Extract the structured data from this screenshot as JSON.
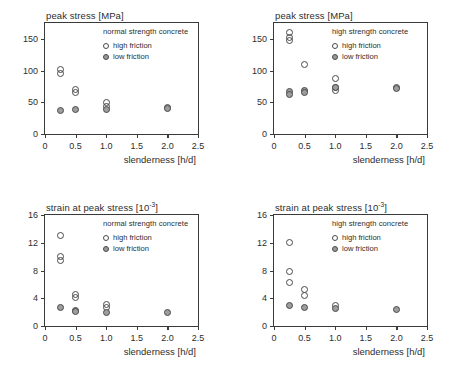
{
  "figure": {
    "panels": [
      {
        "key": "top-left",
        "ylabel": "peak stress [MPa]",
        "xlabel": "slenderness [h/d]",
        "legend_title": "normal strength concrete",
        "legend": [
          {
            "marker": "open-circle",
            "label": "high friction"
          },
          {
            "marker": "filled-circle",
            "label": "low friction"
          }
        ]
      },
      {
        "key": "top-right",
        "ylabel": "peak stress [MPa]",
        "xlabel": "slenderness [h/d]",
        "legend_title": "high strength concrete",
        "legend": [
          {
            "marker": "open-circle",
            "label": "high friction"
          },
          {
            "marker": "filled-circle",
            "label": "low friction"
          }
        ]
      },
      {
        "key": "bottom-left",
        "ylabel_html": "strain at peak stress [10<sup>-3</sup>]",
        "ylabel": "strain at peak stress [10-3]",
        "xlabel": "slenderness [h/d]",
        "legend_title": "normal strength concrete",
        "legend": [
          {
            "marker": "open-circle",
            "label": "high friction"
          },
          {
            "marker": "filled-circle",
            "label": "low friction"
          }
        ]
      },
      {
        "key": "bottom-right",
        "ylabel_html": "strain at peak stress [10<sup>-3</sup>]",
        "ylabel": "strain at peak stress [10-3]",
        "xlabel": "slenderness [h/d]",
        "legend_title": "high strength concrete",
        "legend": [
          {
            "marker": "open-circle",
            "label": "high friction"
          },
          {
            "marker": "filled-circle",
            "label": "low friction"
          }
        ]
      }
    ]
  },
  "chart_data": [
    {
      "id": "top-left",
      "type": "scatter",
      "title": "",
      "subtitle": "normal strength concrete",
      "xlabel": "slenderness [h/d]",
      "ylabel": "peak stress [MPa]",
      "xlim": [
        0,
        2.5
      ],
      "ylim": [
        0,
        175
      ],
      "xticks": [
        0,
        0.5,
        1.0,
        1.5,
        2.0,
        2.5
      ],
      "xticklabels": [
        "0",
        "0.5",
        "1.0",
        "1.5",
        "2.0",
        "2.5"
      ],
      "yticks": [
        0,
        50,
        100,
        150
      ],
      "yticklabels": [
        "0",
        "50",
        "100",
        "150"
      ],
      "grid": false,
      "legend_position": "upper-right-inside",
      "series": [
        {
          "name": "high friction",
          "marker": "open-circle",
          "points": [
            {
              "x": 0.25,
              "y": 102
            },
            {
              "x": 0.25,
              "y": 95
            },
            {
              "x": 0.5,
              "y": 70
            },
            {
              "x": 0.5,
              "y": 66
            },
            {
              "x": 1.0,
              "y": 50
            },
            {
              "x": 1.0,
              "y": 44
            },
            {
              "x": 2.0,
              "y": 41
            }
          ]
        },
        {
          "name": "low friction",
          "marker": "filled-circle",
          "points": [
            {
              "x": 0.25,
              "y": 37
            },
            {
              "x": 0.5,
              "y": 38
            },
            {
              "x": 1.0,
              "y": 39
            },
            {
              "x": 2.0,
              "y": 40
            }
          ]
        }
      ]
    },
    {
      "id": "top-right",
      "type": "scatter",
      "title": "",
      "subtitle": "high strength concrete",
      "xlabel": "slenderness [h/d]",
      "ylabel": "peak stress [MPa]",
      "xlim": [
        0,
        2.5
      ],
      "ylim": [
        0,
        175
      ],
      "xticks": [
        0,
        0.5,
        1.0,
        1.5,
        2.0,
        2.5
      ],
      "xticklabels": [
        "0",
        "0.5",
        "1.0",
        "1.5",
        "2.0",
        "2.5"
      ],
      "yticks": [
        0,
        50,
        100,
        150
      ],
      "yticklabels": [
        "0",
        "50",
        "100",
        "150"
      ],
      "grid": false,
      "legend_position": "upper-right-inside",
      "series": [
        {
          "name": "high friction",
          "marker": "open-circle",
          "points": [
            {
              "x": 0.25,
              "y": 160
            },
            {
              "x": 0.25,
              "y": 152
            },
            {
              "x": 0.25,
              "y": 148
            },
            {
              "x": 0.5,
              "y": 109
            },
            {
              "x": 1.0,
              "y": 88
            },
            {
              "x": 1.0,
              "y": 74
            },
            {
              "x": 1.0,
              "y": 69
            },
            {
              "x": 2.0,
              "y": 74
            }
          ]
        },
        {
          "name": "low friction",
          "marker": "filled-circle",
          "points": [
            {
              "x": 0.25,
              "y": 67
            },
            {
              "x": 0.25,
              "y": 63
            },
            {
              "x": 0.5,
              "y": 68
            },
            {
              "x": 0.5,
              "y": 65
            },
            {
              "x": 1.0,
              "y": 73
            },
            {
              "x": 2.0,
              "y": 71
            }
          ]
        }
      ]
    },
    {
      "id": "bottom-left",
      "type": "scatter",
      "title": "",
      "subtitle": "normal strength concrete",
      "xlabel": "slenderness [h/d]",
      "ylabel": "strain at peak stress [10-3]",
      "xlim": [
        0,
        2.5
      ],
      "ylim": [
        0,
        16
      ],
      "xticks": [
        0,
        0.5,
        1.0,
        1.5,
        2.0,
        2.5
      ],
      "xticklabels": [
        "0",
        "0.5",
        "1.0",
        "1.5",
        "2.0",
        "2.5"
      ],
      "yticks": [
        0,
        4,
        8,
        12,
        16
      ],
      "yticklabels": [
        "0",
        "4",
        "8",
        "12",
        "16"
      ],
      "grid": false,
      "legend_position": "upper-right-inside",
      "series": [
        {
          "name": "high friction",
          "marker": "open-circle",
          "points": [
            {
              "x": 0.25,
              "y": 13.0
            },
            {
              "x": 0.25,
              "y": 10.0
            },
            {
              "x": 0.25,
              "y": 9.5
            },
            {
              "x": 0.5,
              "y": 4.5
            },
            {
              "x": 0.5,
              "y": 4.1
            },
            {
              "x": 1.0,
              "y": 3.1
            },
            {
              "x": 1.0,
              "y": 2.6
            }
          ]
        },
        {
          "name": "low friction",
          "marker": "filled-circle",
          "points": [
            {
              "x": 0.25,
              "y": 2.7
            },
            {
              "x": 0.5,
              "y": 2.3
            },
            {
              "x": 0.5,
              "y": 2.1
            },
            {
              "x": 1.0,
              "y": 2.0
            },
            {
              "x": 2.0,
              "y": 2.0
            }
          ]
        }
      ]
    },
    {
      "id": "bottom-right",
      "type": "scatter",
      "title": "",
      "subtitle": "high strength concrete",
      "xlabel": "slenderness [h/d]",
      "ylabel": "strain at peak stress [10-3]",
      "xlim": [
        0,
        2.5
      ],
      "ylim": [
        0,
        16
      ],
      "xticks": [
        0,
        0.5,
        1.0,
        1.5,
        2.0,
        2.5
      ],
      "xticklabels": [
        "0",
        "0.5",
        "1.0",
        "1.5",
        "2.0",
        "2.5"
      ],
      "yticks": [
        0,
        4,
        8,
        12,
        16
      ],
      "yticklabels": [
        "0",
        "4",
        "8",
        "12",
        "16"
      ],
      "grid": false,
      "legend_position": "upper-right-inside",
      "series": [
        {
          "name": "high friction",
          "marker": "open-circle",
          "points": [
            {
              "x": 0.25,
              "y": 12.0
            },
            {
              "x": 0.25,
              "y": 7.9
            },
            {
              "x": 0.25,
              "y": 6.3
            },
            {
              "x": 0.5,
              "y": 5.2
            },
            {
              "x": 0.5,
              "y": 4.4
            },
            {
              "x": 1.0,
              "y": 2.9
            }
          ]
        },
        {
          "name": "low friction",
          "marker": "filled-circle",
          "points": [
            {
              "x": 0.25,
              "y": 3.0
            },
            {
              "x": 0.5,
              "y": 2.6
            },
            {
              "x": 1.0,
              "y": 2.5
            },
            {
              "x": 2.0,
              "y": 2.4
            }
          ]
        }
      ]
    }
  ]
}
